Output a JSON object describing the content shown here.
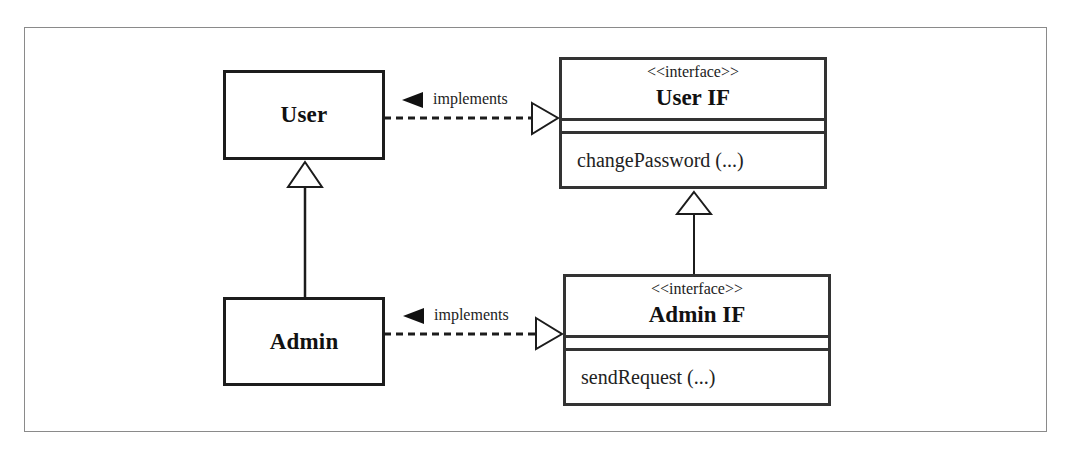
{
  "diagram": {
    "type": "UML class diagram",
    "classes": [
      {
        "id": "user",
        "name": "User"
      },
      {
        "id": "admin",
        "name": "Admin"
      }
    ],
    "interfaces": [
      {
        "id": "user_if",
        "stereotype": "<<interface>>",
        "name": "User IF",
        "operations": [
          "changePassword (...)"
        ]
      },
      {
        "id": "admin_if",
        "stereotype": "<<interface>>",
        "name": "Admin IF",
        "operations": [
          "sendRequest (...)"
        ]
      }
    ],
    "relations": [
      {
        "from": "User",
        "to": "User IF",
        "kind": "realization",
        "label": "implements",
        "label_direction_icon": "triangle-left-filled"
      },
      {
        "from": "Admin",
        "to": "Admin IF",
        "kind": "realization",
        "label": "implements",
        "label_direction_icon": "triangle-left-filled"
      },
      {
        "from": "Admin",
        "to": "User",
        "kind": "generalization"
      },
      {
        "from": "Admin IF",
        "to": "User IF",
        "kind": "generalization"
      }
    ]
  },
  "labels": {
    "implements_top": "implements",
    "implements_bottom": "implements"
  },
  "colors": {
    "line": "#1c1c1c",
    "frame": "#8a8a8a",
    "background": "#ffffff"
  }
}
